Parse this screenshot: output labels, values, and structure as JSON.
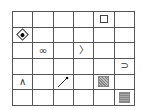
{
  "grid": {
    "rows": 6,
    "cols": 6,
    "cells": [
      {
        "row": 0,
        "col": 4,
        "symbol": "square-outline",
        "glyph": ""
      },
      {
        "row": 1,
        "col": 0,
        "symbol": "diamond-dot",
        "glyph": ""
      },
      {
        "row": 2,
        "col": 1,
        "symbol": "infinity",
        "glyph": "∞"
      },
      {
        "row": 2,
        "col": 3,
        "symbol": "right-angle-bracket",
        "glyph": "〉"
      },
      {
        "row": 3,
        "col": 5,
        "symbol": "superset",
        "glyph": "⊃"
      },
      {
        "row": 4,
        "col": 0,
        "symbol": "logical-and",
        "glyph": "∧"
      },
      {
        "row": 4,
        "col": 2,
        "symbol": "diagonal-pin",
        "glyph": ""
      },
      {
        "row": 4,
        "col": 4,
        "symbol": "hatched-square",
        "glyph": ""
      },
      {
        "row": 5,
        "col": 5,
        "symbol": "striped-square",
        "glyph": ""
      }
    ]
  }
}
